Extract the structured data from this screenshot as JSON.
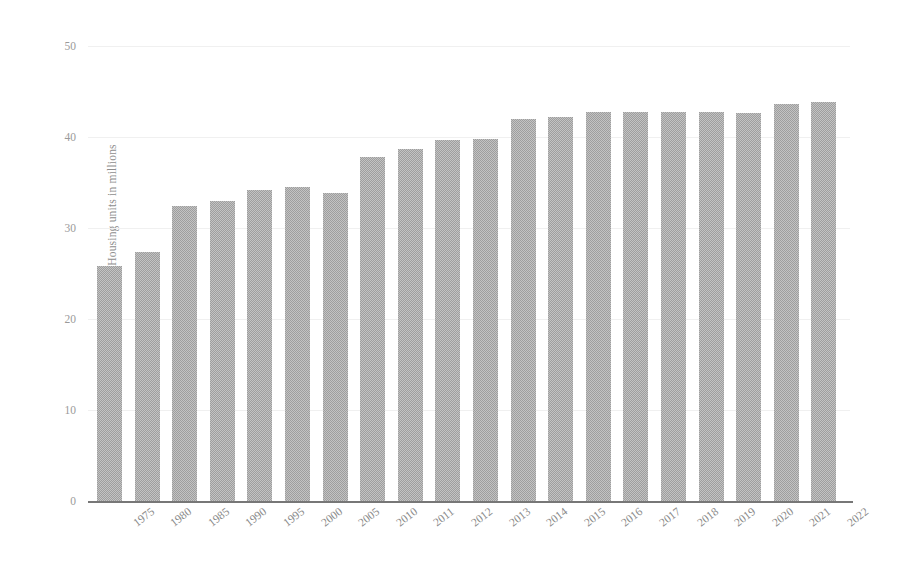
{
  "chart_data": {
    "type": "bar",
    "title": "",
    "subtitle": "",
    "xlabel": "",
    "ylabel": "Housing units in millions",
    "ylim": [
      0,
      50
    ],
    "yticks": [
      0,
      10,
      20,
      30,
      40,
      50
    ],
    "ytick_labels": [
      "0",
      "10",
      "20",
      "30",
      "40",
      "50"
    ],
    "grid": true,
    "legend": null,
    "bar_color": "#9e9e9e",
    "categories": [
      "1975",
      "1980",
      "1985",
      "1990",
      "1995",
      "2000",
      "2005",
      "2010",
      "2011",
      "2012",
      "2013",
      "2014",
      "2015",
      "2016",
      "2017",
      "2018",
      "2019",
      "2020",
      "2021",
      "2022"
    ],
    "values": [
      25.8,
      27.4,
      32.4,
      33.0,
      34.2,
      34.5,
      33.9,
      37.8,
      38.7,
      39.7,
      39.8,
      42.0,
      42.2,
      42.7,
      42.8,
      42.7,
      42.7,
      42.6,
      43.6,
      43.8
    ],
    "series": [
      {
        "name": "Housing units",
        "values": [
          25.8,
          27.4,
          32.4,
          33.0,
          34.2,
          34.5,
          33.9,
          37.8,
          38.7,
          39.7,
          39.8,
          42.0,
          42.2,
          42.7,
          42.8,
          42.7,
          42.7,
          42.6,
          43.6,
          43.8
        ]
      }
    ]
  }
}
